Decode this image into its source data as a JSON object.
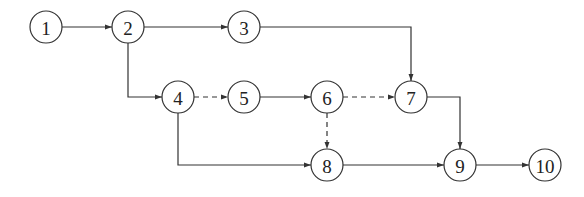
{
  "diagram": {
    "type": "activity-on-arrow network diagram",
    "node_radius": 16,
    "nodes": [
      {
        "id": "1",
        "label": "1",
        "x": 46,
        "y": 27
      },
      {
        "id": "2",
        "label": "2",
        "x": 128,
        "y": 27
      },
      {
        "id": "3",
        "label": "3",
        "x": 244,
        "y": 27
      },
      {
        "id": "4",
        "label": "4",
        "x": 178,
        "y": 97
      },
      {
        "id": "5",
        "label": "5",
        "x": 244,
        "y": 97
      },
      {
        "id": "6",
        "label": "6",
        "x": 327,
        "y": 97
      },
      {
        "id": "7",
        "label": "7",
        "x": 411,
        "y": 97
      },
      {
        "id": "8",
        "label": "8",
        "x": 327,
        "y": 165
      },
      {
        "id": "9",
        "label": "9",
        "x": 460,
        "y": 165
      },
      {
        "id": "10",
        "label": "10",
        "x": 545,
        "y": 165
      }
    ],
    "edges": [
      {
        "from": "1",
        "to": "2",
        "style": "solid"
      },
      {
        "from": "2",
        "to": "3",
        "style": "solid"
      },
      {
        "from": "2",
        "to": "4",
        "style": "solid",
        "route": "down-then-right"
      },
      {
        "from": "3",
        "to": "7",
        "style": "solid",
        "route": "right-then-down"
      },
      {
        "from": "4",
        "to": "5",
        "style": "dashed"
      },
      {
        "from": "4",
        "to": "8",
        "style": "solid",
        "route": "down-then-right"
      },
      {
        "from": "5",
        "to": "6",
        "style": "solid"
      },
      {
        "from": "6",
        "to": "7",
        "style": "dashed"
      },
      {
        "from": "6",
        "to": "8",
        "style": "dashed"
      },
      {
        "from": "7",
        "to": "9",
        "style": "solid",
        "route": "right-then-down"
      },
      {
        "from": "8",
        "to": "9",
        "style": "solid"
      },
      {
        "from": "9",
        "to": "10",
        "style": "solid"
      }
    ]
  }
}
